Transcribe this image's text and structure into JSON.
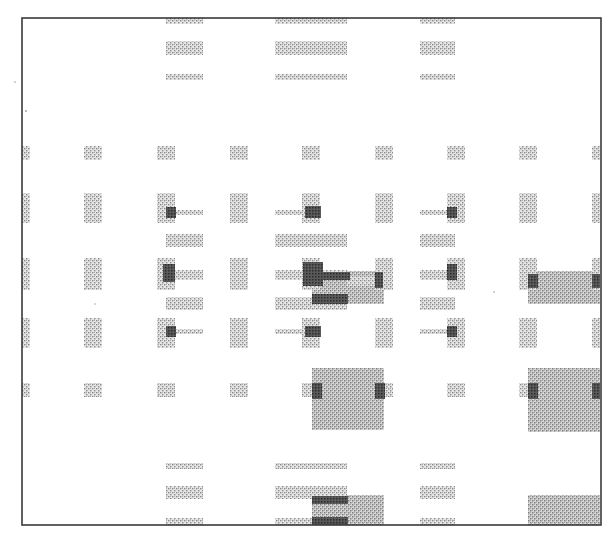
{
  "figure": {
    "kind": "scanned halftone layout diagram",
    "colors": {
      "background": "#ffffff",
      "frame": "#3a3a3a",
      "light_pattern": "#b8b8b8",
      "medium_pattern": "#a0a0a0",
      "dark_overlap": "#3c3c3c"
    },
    "elements": {
      "frame": "outer border",
      "column_pads": "vertical stippled pads arranged in a grid",
      "row_bars": "horizontal stippled bars",
      "overlap_marks": "dark overlap regions where pads and bars intersect",
      "fill_blocks": "large stippled rectangular fill regions"
    },
    "grid": {
      "pad_columns": 9,
      "pad_rows": 5,
      "bar_groups_top": 3,
      "bar_groups_bottom": 3
    }
  }
}
